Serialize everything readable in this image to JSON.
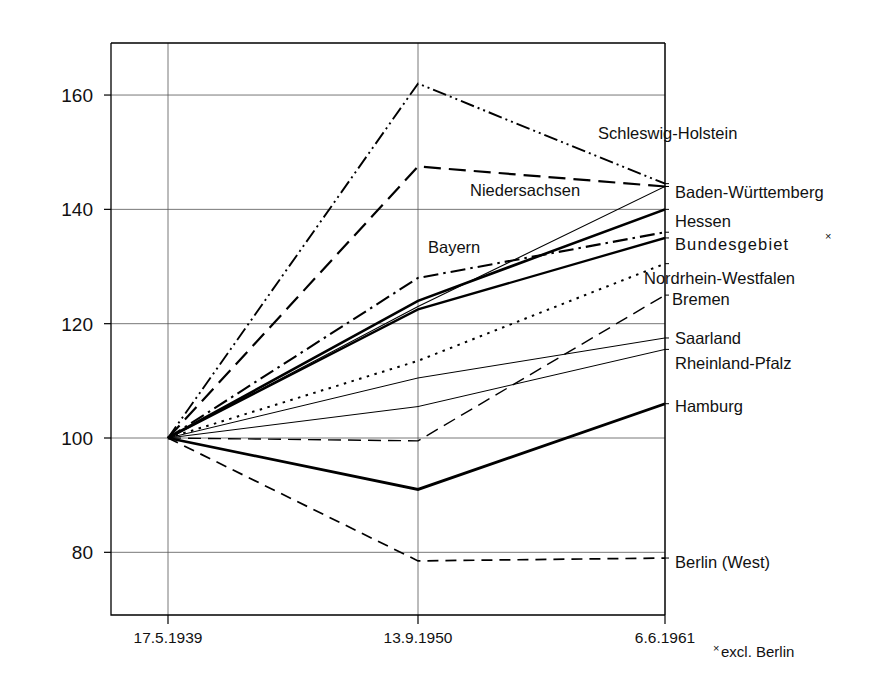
{
  "chart_data": {
    "type": "line",
    "title": "",
    "subtitle": "",
    "xlabel": "",
    "ylabel": "",
    "grid": true,
    "legend_position": "right-inline-labels",
    "x": [
      "17.5.1939",
      "13.9.1950",
      "6.6.1961"
    ],
    "x_tick_labels": [
      "17.5.1939",
      "13.9.1950",
      "6.6.1961"
    ],
    "y_tick_labels": [
      "160",
      "140",
      "120",
      "100",
      "80"
    ],
    "y_ticks": [
      160,
      140,
      120,
      100,
      80
    ],
    "ylim": [
      70,
      172
    ],
    "footnote": "excl. Berlin",
    "footnote_mark": "×",
    "series": [
      {
        "name": "Schleswig-Holstein",
        "values": [
          100,
          162.0,
          144.5
        ],
        "style": "dash-dot-dot",
        "width": 1.9
      },
      {
        "name": "Niedersachsen",
        "values": [
          100,
          147.5,
          144.0
        ],
        "style": "long-dash",
        "width": 2.2
      },
      {
        "name": "Baden-Württemberg",
        "values": [
          100,
          123.0,
          144.0
        ],
        "style": "thin-solid",
        "width": 1.1
      },
      {
        "name": "Hessen",
        "values": [
          100,
          124.0,
          140.0
        ],
        "style": "solid",
        "width": 2.6
      },
      {
        "name": "Bayern",
        "values": [
          100,
          128.0,
          136.0
        ],
        "style": "dash-dot",
        "width": 2.1
      },
      {
        "name": "Bundesgebiet",
        "values": [
          100,
          122.5,
          135.0
        ],
        "style": "solid",
        "width": 2.3
      },
      {
        "name": "Nordrhein-Westfalen",
        "values": [
          100,
          113.5,
          130.5
        ],
        "style": "dotted",
        "width": 2.0
      },
      {
        "name": "Bremen",
        "values": [
          100,
          99.5,
          125.0
        ],
        "style": "dash-long",
        "width": 1.4
      },
      {
        "name": "Saarland",
        "values": [
          100,
          110.5,
          117.5
        ],
        "style": "thin-solid",
        "width": 1.0
      },
      {
        "name": "Rheinland-Pfalz",
        "values": [
          100,
          105.5,
          115.5
        ],
        "style": "thin-solid",
        "width": 1.0
      },
      {
        "name": "Hamburg",
        "values": [
          100,
          91.0,
          106.0
        ],
        "style": "solid",
        "width": 2.8
      },
      {
        "name": "Berlin (West)",
        "values": [
          100,
          78.5,
          79.0
        ],
        "style": "dashed",
        "width": 1.7
      }
    ],
    "inline_labels": [
      {
        "text": "Schleswig-Holstein",
        "x": 598,
        "y": 139,
        "anchor": "start",
        "wide": false
      },
      {
        "text": "Niedersachsen",
        "x": 470,
        "y": 196,
        "anchor": "start",
        "wide": false
      },
      {
        "text": "Bayern",
        "x": 428,
        "y": 253,
        "anchor": "start",
        "wide": false
      },
      {
        "text": "Baden-Württemberg",
        "x": 675,
        "y": 198,
        "anchor": "start",
        "wide": false
      },
      {
        "text": "Hessen",
        "x": 675,
        "y": 227,
        "anchor": "start",
        "wide": false
      },
      {
        "text": "Bundesgebiet",
        "x": 675,
        "y": 250,
        "anchor": "start",
        "wide": true
      },
      {
        "text": "Nordrhein-Westfalen",
        "x": 644,
        "y": 284,
        "anchor": "start",
        "wide": false
      },
      {
        "text": "Bremen",
        "x": 672,
        "y": 305,
        "anchor": "start",
        "wide": false
      },
      {
        "text": "Saarland",
        "x": 675,
        "y": 344,
        "anchor": "start",
        "wide": false
      },
      {
        "text": "Rheinland-Pfalz",
        "x": 675,
        "y": 369,
        "anchor": "start",
        "wide": false
      },
      {
        "text": "Hamburg",
        "x": 675,
        "y": 412,
        "anchor": "start",
        "wide": false
      },
      {
        "text": "Berlin (West)",
        "x": 675,
        "y": 568,
        "anchor": "start",
        "wide": false
      }
    ]
  },
  "geometry": {
    "plot_left": 111,
    "plot_right": 665,
    "plot_top": 43,
    "plot_bottom": 615,
    "x_positions": [
      168,
      418,
      665
    ],
    "y_value_100": 438,
    "px_per_unit": 5.716
  }
}
